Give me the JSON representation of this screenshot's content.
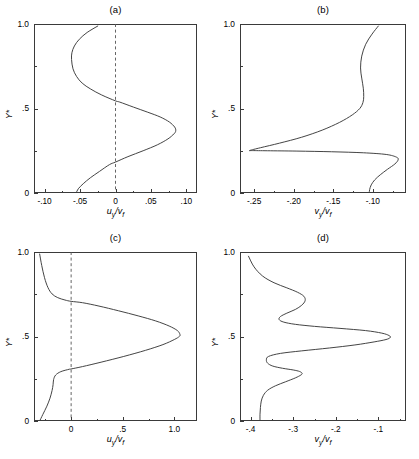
{
  "figure": {
    "width": 419,
    "height": 459,
    "background": "#ffffff",
    "line_color": "#3a3a3a",
    "dashed_color": "#555555"
  },
  "panels": [
    {
      "id": "a",
      "title": "(a)",
      "ylabel": "Y*",
      "xlabel_main": "u",
      "xlabel_sub1": "y",
      "xlabel_den": "/v",
      "xlabel_sub2": "f",
      "xticks": [
        "-.10",
        "-.05",
        "0",
        ".05",
        ".10"
      ],
      "xtick_values": [
        -0.1,
        -0.05,
        0,
        0.05,
        0.1
      ],
      "yticks": [
        "0",
        ".5",
        "1.0"
      ],
      "ytick_values": [
        0,
        0.5,
        1.0
      ],
      "xlim": [
        -0.115,
        0.115
      ],
      "ylim": [
        0,
        1.0
      ],
      "zero_line": 0,
      "has_zero_line": true
    },
    {
      "id": "b",
      "title": "(b)",
      "ylabel": "Y*",
      "xlabel_main": "v",
      "xlabel_sub1": "y",
      "xlabel_den": "/v",
      "xlabel_sub2": "f",
      "xticks": [
        "-.25",
        "-.20",
        "-.15",
        "-.10"
      ],
      "xtick_values": [
        -0.25,
        -0.2,
        -0.15,
        -0.1
      ],
      "yticks": [
        "0",
        ".5",
        "1.0"
      ],
      "ytick_values": [
        0,
        0.5,
        1.0
      ],
      "xlim": [
        -0.268,
        -0.058
      ],
      "ylim": [
        0,
        1.0
      ],
      "has_zero_line": false
    },
    {
      "id": "c",
      "title": "(c)",
      "ylabel": "Y*",
      "xlabel_main": "u",
      "xlabel_sub1": "y",
      "xlabel_den": "/v",
      "xlabel_sub2": "f",
      "xticks": [
        "0",
        ".5",
        "1.0"
      ],
      "xtick_values": [
        0,
        0.5,
        1.0
      ],
      "yticks": [
        "0",
        ".5",
        "1.0"
      ],
      "ytick_values": [
        0,
        0.5,
        1.0
      ],
      "xlim": [
        -0.36,
        1.22
      ],
      "ylim": [
        0,
        1.0
      ],
      "zero_line": 0,
      "has_zero_line": true
    },
    {
      "id": "d",
      "title": "(d)",
      "ylabel": "Y*",
      "xlabel_main": "v",
      "xlabel_sub1": "y",
      "xlabel_den": "/v",
      "xlabel_sub2": "f",
      "xticks": [
        "-.4",
        "-.3",
        "-.2",
        "-.1"
      ],
      "xtick_values": [
        -0.4,
        -0.3,
        -0.2,
        -0.1
      ],
      "yticks": [
        "0",
        ".5",
        "1.0"
      ],
      "ytick_values": [
        0,
        0.5,
        1.0
      ],
      "xlim": [
        -0.425,
        -0.035
      ],
      "ylim": [
        0,
        1.0
      ],
      "has_zero_line": false
    }
  ],
  "chart_data": [
    {
      "type": "line",
      "panel": "a",
      "title": "(a)",
      "xlabel": "u_y/v_f",
      "ylabel": "Y*",
      "xlim": [
        -0.115,
        0.115
      ],
      "ylim": [
        0,
        1.0
      ],
      "xticks": [
        -0.1,
        -0.05,
        0,
        0.05,
        0.1
      ],
      "yticks": [
        0,
        0.5,
        1.0
      ],
      "grid": false,
      "legend": "none",
      "annotations": [
        "vertical dashed reference line at x = 0"
      ],
      "series": [
        {
          "name": "u_y/v_f profile",
          "x": [
            -0.0555,
            -0.0525,
            -0.0455,
            -0.0355,
            -0.0225,
            -0.0085,
            0.0,
            0.0175,
            0.039,
            0.059,
            0.074,
            0.0825,
            0.085,
            0.0835,
            0.076,
            0.063,
            0.0455,
            0.0255,
            0.006,
            0.0,
            -0.0195,
            -0.035,
            -0.047,
            -0.055,
            -0.06,
            -0.062,
            -0.0615,
            -0.058,
            -0.051,
            -0.04,
            -0.025
          ],
          "y": [
            0.0,
            0.025,
            0.055,
            0.09,
            0.128,
            0.168,
            0.183,
            0.215,
            0.25,
            0.285,
            0.32,
            0.35,
            0.368,
            0.39,
            0.42,
            0.45,
            0.478,
            0.508,
            0.538,
            0.545,
            0.58,
            0.615,
            0.65,
            0.69,
            0.735,
            0.79,
            0.83,
            0.87,
            0.91,
            0.95,
            0.988
          ]
        }
      ]
    },
    {
      "type": "line",
      "panel": "b",
      "title": "(b)",
      "xlabel": "v_y/v_f",
      "ylabel": "Y*",
      "xlim": [
        -0.268,
        -0.058
      ],
      "ylim": [
        0,
        1.0
      ],
      "xticks": [
        -0.25,
        -0.2,
        -0.15,
        -0.1
      ],
      "yticks": [
        0,
        0.5,
        1.0
      ],
      "grid": false,
      "legend": "none",
      "annotations": [],
      "series": [
        {
          "name": "v_y/v_f profile",
          "x": [
            -0.1045,
            -0.104,
            -0.102,
            -0.0975,
            -0.0905,
            -0.0815,
            -0.072,
            -0.068,
            -0.07,
            -0.083,
            -0.112,
            -0.152,
            -0.196,
            -0.233,
            -0.252,
            -0.2555,
            -0.242,
            -0.218,
            -0.19,
            -0.164,
            -0.142,
            -0.126,
            -0.1165,
            -0.1125,
            -0.1115,
            -0.112,
            -0.114,
            -0.1155,
            -0.114,
            -0.109,
            -0.101,
            -0.093
          ],
          "y": [
            0.0,
            0.02,
            0.048,
            0.078,
            0.108,
            0.14,
            0.172,
            0.196,
            0.212,
            0.228,
            0.238,
            0.244,
            0.248,
            0.25,
            0.251,
            0.252,
            0.268,
            0.295,
            0.33,
            0.372,
            0.418,
            0.462,
            0.5,
            0.535,
            0.57,
            0.62,
            0.68,
            0.74,
            0.81,
            0.88,
            0.94,
            0.988
          ]
        }
      ]
    },
    {
      "type": "line",
      "panel": "c",
      "title": "(c)",
      "xlabel": "u_y/v_f",
      "ylabel": "Y*",
      "xlim": [
        -0.36,
        1.22
      ],
      "ylim": [
        0,
        1.0
      ],
      "xticks": [
        0,
        0.5,
        1.0
      ],
      "yticks": [
        0,
        0.5,
        1.0
      ],
      "grid": false,
      "legend": "none",
      "annotations": [
        "vertical dashed reference line at x = 0"
      ],
      "series": [
        {
          "name": "u_y/v_f profile",
          "x": [
            -0.305,
            -0.275,
            -0.235,
            -0.205,
            -0.185,
            -0.175,
            -0.17,
            -0.15,
            -0.1,
            -0.02,
            0.0,
            0.11,
            0.29,
            0.51,
            0.72,
            0.89,
            1.0,
            1.048,
            1.055,
            1.03,
            0.95,
            0.82,
            0.65,
            0.46,
            0.27,
            0.11,
            0.0,
            -0.06,
            -0.13,
            -0.185,
            -0.225,
            -0.258,
            -0.285,
            -0.305
          ],
          "y": [
            0.0,
            0.038,
            0.088,
            0.135,
            0.18,
            0.215,
            0.245,
            0.272,
            0.292,
            0.306,
            0.308,
            0.322,
            0.348,
            0.382,
            0.418,
            0.452,
            0.482,
            0.5,
            0.512,
            0.535,
            0.562,
            0.592,
            0.622,
            0.652,
            0.68,
            0.7,
            0.708,
            0.716,
            0.73,
            0.752,
            0.79,
            0.848,
            0.92,
            0.988
          ]
        }
      ]
    },
    {
      "type": "line",
      "panel": "d",
      "title": "(d)",
      "xlabel": "v_y/v_f",
      "ylabel": "Y*",
      "xlim": [
        -0.425,
        -0.035
      ],
      "ylim": [
        0,
        1.0
      ],
      "xticks": [
        -0.4,
        -0.3,
        -0.2,
        -0.1
      ],
      "yticks": [
        0,
        0.5,
        1.0
      ],
      "grid": false,
      "legend": "none",
      "annotations": [],
      "series": [
        {
          "name": "v_y/v_f profile",
          "x": [
            -0.378,
            -0.378,
            -0.377,
            -0.375,
            -0.37,
            -0.36,
            -0.342,
            -0.318,
            -0.295,
            -0.282,
            -0.279,
            -0.285,
            -0.3,
            -0.325,
            -0.348,
            -0.36,
            -0.363,
            -0.358,
            -0.33,
            -0.28,
            -0.215,
            -0.155,
            -0.11,
            -0.082,
            -0.072,
            -0.075,
            -0.092,
            -0.13,
            -0.19,
            -0.25,
            -0.295,
            -0.322,
            -0.333,
            -0.33,
            -0.315,
            -0.295,
            -0.28,
            -0.272,
            -0.275,
            -0.29,
            -0.315,
            -0.345,
            -0.372,
            -0.392,
            -0.405
          ],
          "y": [
            0.0,
            0.04,
            0.08,
            0.118,
            0.152,
            0.182,
            0.208,
            0.232,
            0.255,
            0.272,
            0.282,
            0.293,
            0.302,
            0.312,
            0.325,
            0.342,
            0.362,
            0.382,
            0.4,
            0.415,
            0.432,
            0.45,
            0.468,
            0.482,
            0.494,
            0.506,
            0.52,
            0.535,
            0.548,
            0.56,
            0.572,
            0.585,
            0.6,
            0.618,
            0.638,
            0.66,
            0.685,
            0.712,
            0.738,
            0.762,
            0.788,
            0.818,
            0.858,
            0.912,
            0.975
          ]
        }
      ]
    }
  ]
}
